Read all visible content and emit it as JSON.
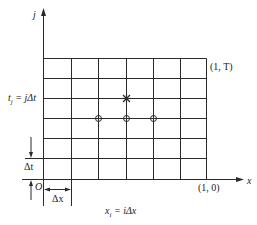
{
  "diagram": {
    "type": "finite-difference grid",
    "colors": {
      "line": "#2a2a2a",
      "background": "#ffffff"
    },
    "axes": {
      "x_label": "x",
      "y_label": "j",
      "origin_label": "O"
    },
    "grid": {
      "columns": 6,
      "rows": 6
    },
    "labels": {
      "top_right_corner": "(1, T)",
      "bottom_right_corner": "(1, 0)",
      "time_level": "tⱼ = jΔt",
      "time_level_main": "t",
      "time_level_sub": "j",
      "time_level_rest": " = jΔt",
      "delta_t": "Δt",
      "delta_x": "Δx",
      "space_point_main": "x",
      "space_point_sub": "i",
      "space_point_rest": " = iΔx"
    },
    "markers": {
      "star": {
        "symbol": "asterisk",
        "grid_position": [
          3,
          4
        ]
      },
      "circles": [
        {
          "symbol": "circle-cross",
          "grid_position": [
            2,
            3
          ]
        },
        {
          "symbol": "circle-cross",
          "grid_position": [
            3,
            3
          ]
        },
        {
          "symbol": "circle-cross",
          "grid_position": [
            4,
            3
          ]
        }
      ]
    }
  }
}
